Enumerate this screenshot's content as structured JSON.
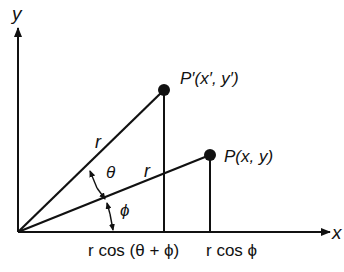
{
  "axes": {
    "x_label": "x",
    "y_label": "y"
  },
  "points": {
    "p_prime": {
      "label": "P′(x′, y′)"
    },
    "p": {
      "label": "P(x, y)"
    }
  },
  "segments": {
    "r_upper": "r",
    "r_lower": "r"
  },
  "angles": {
    "theta": "θ",
    "phi": "ϕ"
  },
  "x_annotations": {
    "left": "r cos (θ + ϕ)",
    "right": "r cos ϕ"
  },
  "colors": {
    "ink": "#111111",
    "background": "#ffffff"
  }
}
